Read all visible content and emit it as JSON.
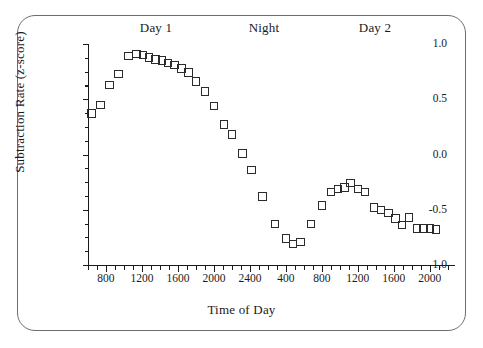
{
  "figure": {
    "x_axis_title": "Time of Day",
    "y_axis_title": "Subtraction Rate (z-score)",
    "period_labels": [
      {
        "text": "Day 1",
        "x_px": 156
      },
      {
        "text": "Night",
        "x_px": 264
      },
      {
        "text": "Day 2",
        "x_px": 375
      }
    ]
  },
  "chart_data": {
    "type": "scatter",
    "title": "",
    "xlabel": "Time of Day",
    "ylabel": "Subtraction Rate (z-score)",
    "xlim": [
      600,
      4680
    ],
    "ylim": [
      -1.0,
      1.0
    ],
    "grid": false,
    "legend": null,
    "marker": "open-square",
    "annotations": [
      "Day 1",
      "Night",
      "Day 2"
    ],
    "ytick_labels": [
      "1.0",
      "0.5",
      "0.0",
      "-0.5",
      "-1.0"
    ],
    "ytick_values": [
      1.0,
      0.5,
      0.0,
      -0.5,
      -1.0
    ],
    "y_minor_ticks": [
      0.875,
      0.75,
      0.625,
      0.375,
      0.25,
      0.125,
      -0.125,
      -0.25,
      -0.375,
      -0.625,
      -0.75,
      -0.875
    ],
    "xtick_labels": [
      "800",
      "1200",
      "1600",
      "2000",
      "2400",
      "400",
      "800",
      "1200",
      "1600",
      "2000"
    ],
    "xtick_values": [
      800,
      1200,
      1600,
      2000,
      2400,
      2800,
      3200,
      3600,
      4000,
      4400
    ],
    "x_minor_step": 100,
    "series": [
      {
        "name": "Subtraction rate",
        "points": [
          {
            "x": 640,
            "y": 0.37
          },
          {
            "x": 740,
            "y": 0.45
          },
          {
            "x": 840,
            "y": 0.63
          },
          {
            "x": 940,
            "y": 0.73
          },
          {
            "x": 1050,
            "y": 0.89
          },
          {
            "x": 1140,
            "y": 0.91
          },
          {
            "x": 1210,
            "y": 0.9
          },
          {
            "x": 1280,
            "y": 0.88
          },
          {
            "x": 1350,
            "y": 0.86
          },
          {
            "x": 1420,
            "y": 0.85
          },
          {
            "x": 1490,
            "y": 0.83
          },
          {
            "x": 1560,
            "y": 0.81
          },
          {
            "x": 1640,
            "y": 0.78
          },
          {
            "x": 1720,
            "y": 0.74
          },
          {
            "x": 1800,
            "y": 0.66
          },
          {
            "x": 1900,
            "y": 0.57
          },
          {
            "x": 2000,
            "y": 0.44
          },
          {
            "x": 2110,
            "y": 0.27
          },
          {
            "x": 2200,
            "y": 0.18
          },
          {
            "x": 2320,
            "y": 0.01
          },
          {
            "x": 2420,
            "y": -0.14
          },
          {
            "x": 2540,
            "y": -0.38
          },
          {
            "x": 2680,
            "y": -0.63
          },
          {
            "x": 2800,
            "y": -0.76
          },
          {
            "x": 2880,
            "y": -0.81
          },
          {
            "x": 2960,
            "y": -0.79
          },
          {
            "x": 3080,
            "y": -0.63
          },
          {
            "x": 3200,
            "y": -0.46
          },
          {
            "x": 3300,
            "y": -0.34
          },
          {
            "x": 3380,
            "y": -0.31
          },
          {
            "x": 3450,
            "y": -0.3
          },
          {
            "x": 3520,
            "y": -0.26
          },
          {
            "x": 3600,
            "y": -0.31
          },
          {
            "x": 3680,
            "y": -0.34
          },
          {
            "x": 3780,
            "y": -0.48
          },
          {
            "x": 3860,
            "y": -0.5
          },
          {
            "x": 3940,
            "y": -0.53
          },
          {
            "x": 4020,
            "y": -0.58
          },
          {
            "x": 4090,
            "y": -0.64
          },
          {
            "x": 4170,
            "y": -0.57
          },
          {
            "x": 4260,
            "y": -0.67
          },
          {
            "x": 4330,
            "y": -0.67
          },
          {
            "x": 4400,
            "y": -0.67
          },
          {
            "x": 4470,
            "y": -0.68
          }
        ]
      }
    ]
  }
}
